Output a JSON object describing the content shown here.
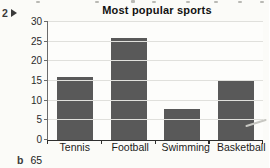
{
  "exercise": {
    "number": "2",
    "marker_icon": "play-triangle"
  },
  "chart_data": {
    "type": "bar",
    "title": "Most popular sports",
    "categories": [
      "Tennis",
      "Football",
      "Swimming",
      "Basketball"
    ],
    "values": [
      16,
      26,
      8,
      15
    ],
    "xlabel": "",
    "ylabel": "",
    "ylim": [
      0,
      30
    ],
    "yticks": [
      0,
      5,
      10,
      15,
      20,
      25,
      30
    ],
    "grid": true,
    "legend": "none",
    "bar_color": "#595959",
    "gridline_color": "#e0e0dc"
  },
  "footer": {
    "item_label": "b",
    "value": "65"
  }
}
